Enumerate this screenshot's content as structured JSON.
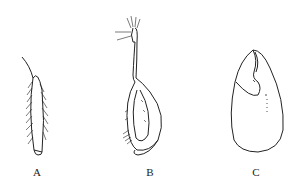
{
  "figure": {
    "panels": [
      {
        "id": "A",
        "label": "A",
        "description": "elongated hairy appendage with fringed setae"
      },
      {
        "id": "B",
        "label": "B",
        "description": "stalked curved structure with bristled tip and hairy lobe"
      },
      {
        "id": "C",
        "label": "C",
        "description": "ovoid outline with inner notch and dotted line"
      }
    ]
  }
}
